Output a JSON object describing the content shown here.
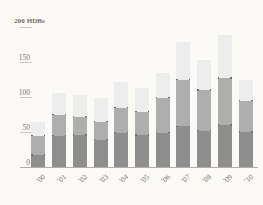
{
  "chart_data": {
    "type": "bar",
    "subtype": "stacked-bar",
    "title": "",
    "xlabel": "",
    "ylabel": "",
    "y_axis_top_label": "200 HDBs",
    "units": "HDBs",
    "categories": [
      "'00",
      "'01",
      "'02",
      "'03",
      "'04",
      "'05",
      "'06",
      "'07",
      "'08",
      "'09",
      "'10"
    ],
    "ylim": [
      0,
      200
    ],
    "yticks": [
      0,
      50,
      100,
      150
    ],
    "ytick_labels": [
      "0",
      "50",
      "100",
      "150"
    ],
    "grid": true,
    "legend": "none",
    "series": [
      {
        "name": "lower",
        "color": "#8e8e8e",
        "values": [
          17,
          45,
          46,
          39,
          49,
          46,
          49,
          58,
          52,
          60,
          50
        ]
      },
      {
        "name": "middle",
        "color": "#aeaeae",
        "values": [
          28,
          30,
          26,
          26,
          36,
          33,
          50,
          67,
          58,
          67,
          45
        ]
      },
      {
        "name": "upper",
        "color": "#ededed",
        "values": [
          19,
          31,
          31,
          33,
          37,
          34,
          35,
          53,
          43,
          62,
          29
        ]
      }
    ],
    "totals": [
      64,
      106,
      103,
      98,
      122,
      113,
      134,
      178,
      153,
      189,
      124
    ]
  },
  "colors": {
    "background": "#fbfaf7",
    "series_low": "#8e8e8e",
    "series_mid": "#aeaeae",
    "series_high": "#ededed",
    "gridline": "#cdc9c2",
    "baseline": "#b3afa8",
    "tick_text": "#7a766f",
    "top_label_text": "#6e6a63"
  }
}
